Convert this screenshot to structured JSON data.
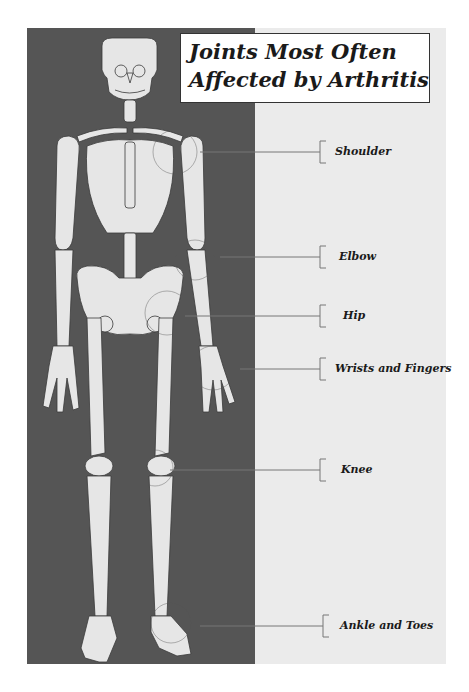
{
  "title": {
    "line1": "Joints Most Often",
    "line2": "Affected by Arthritis"
  },
  "colors": {
    "dark_panel": "#555555",
    "light_panel": "#ebebeb",
    "bone": "#e6e6e6",
    "bone_outline": "#3a3a3a",
    "leader_line": "#777777"
  },
  "joints": [
    {
      "label": "Shoulder",
      "y": 152
    },
    {
      "label": "Elbow",
      "y": 257
    },
    {
      "label": "Hip",
      "y": 316
    },
    {
      "label": "Wrists and Fingers",
      "y": 369
    },
    {
      "label": "Knee",
      "y": 470
    },
    {
      "label": "Ankle and Toes",
      "y": 626
    }
  ]
}
